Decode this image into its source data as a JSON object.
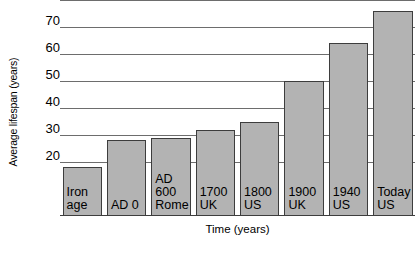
{
  "chart_data": {
    "type": "bar",
    "title": "",
    "xlabel": "Time (years)",
    "ylabel": "Average lifespan (years)",
    "categories": [
      "Iron\nage",
      "AD 0",
      "AD\n600\nRome",
      "1700\nUK",
      "1800\nUS",
      "1900\nUK",
      "1940\nUS",
      "Today\nUS"
    ],
    "values": [
      18,
      28,
      29,
      32,
      35,
      50,
      64,
      76
    ],
    "ylim": [
      0,
      80
    ],
    "yticks": [
      20,
      30,
      40,
      50,
      60,
      70,
      80
    ],
    "ytick_labels": [
      "20",
      "30",
      "40",
      "50",
      "60",
      "70",
      "80"
    ],
    "grid": true,
    "legend": "none",
    "bar_fill_color": "#b3b3b3",
    "bar_border_color": "#3d3d3d",
    "gridline_color": "#6d6d6d"
  }
}
